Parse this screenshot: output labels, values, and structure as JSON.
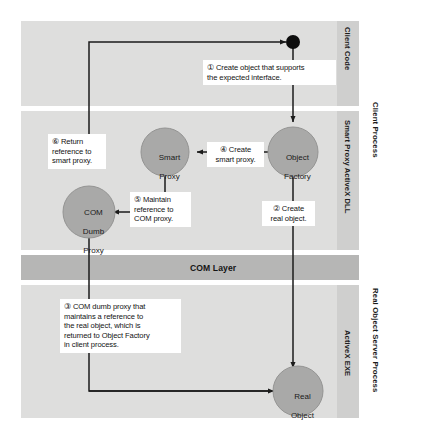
{
  "diagram": {
    "colors": {
      "panel_bg": "#dededd",
      "com_layer_bg": "#b6b6b5",
      "lane_band_bg": "#cfcfce",
      "node_fill": "#a9a9a8",
      "node_stroke": "#8d8d8c",
      "line": "#1b1b1b",
      "callout_bg": "#ffffff",
      "dot": "#0d0d0d"
    },
    "process_labels": [
      {
        "name": "client-process",
        "text": "Client Process"
      },
      {
        "name": "real-object-server-process",
        "text": "Real Object Server Process"
      }
    ],
    "lane_labels": [
      {
        "name": "lane-client-code",
        "text": "Client Code"
      },
      {
        "name": "lane-smart-proxy-dll",
        "text": "Smart Proxy ActiveX DLL"
      },
      {
        "name": "lane-activex-exe",
        "text": "ActiveX EXE"
      }
    ],
    "com_layer": {
      "label": "COM Layer"
    },
    "nodes": [
      {
        "name": "client-code-dot",
        "label": "",
        "shape": "dot"
      },
      {
        "name": "object-factory-node",
        "label": "Object\nFactory",
        "line1": "Object",
        "line2": "Factory"
      },
      {
        "name": "smart-proxy-node",
        "label": "Smart\nProxy",
        "line1": "Smart",
        "line2": "Proxy"
      },
      {
        "name": "com-dumb-proxy-node",
        "label": "COM\nDumb\nProxy",
        "line1": "COM",
        "line2": "Dumb",
        "line3": "Proxy"
      },
      {
        "name": "real-object-node",
        "label": "Real\nObject",
        "line1": "Real",
        "line2": "Object"
      }
    ],
    "callouts": [
      {
        "name": "callout-step-1",
        "step": "①",
        "line1": "① Create object that supports",
        "line2": "the expected interface."
      },
      {
        "name": "callout-step-2",
        "step": "②",
        "line1": "② Create",
        "line2": "real object."
      },
      {
        "name": "callout-step-3",
        "step": "③",
        "line1": "③  COM dumb proxy that",
        "line2": "maintains a reference to",
        "line3": "the real object, which is",
        "line4": "returned to Object Factory",
        "line5": "in client process."
      },
      {
        "name": "callout-step-4",
        "step": "④",
        "line1": "④ Create",
        "line2": "smart proxy."
      },
      {
        "name": "callout-step-5",
        "step": "⑤",
        "line1": "⑤ Maintain",
        "line2": "reference to",
        "line3": "COM proxy."
      },
      {
        "name": "callout-step-6",
        "step": "⑥",
        "line1": "⑥ Return",
        "line2": "reference to",
        "line3": "smart proxy."
      }
    ]
  }
}
